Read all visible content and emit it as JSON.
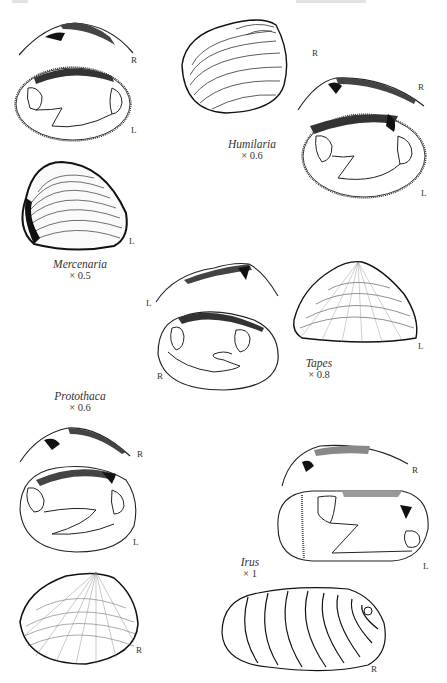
{
  "page": {
    "header_fragments": [
      "page-number-cut-off",
      "running-header-cut-off"
    ]
  },
  "figures": [
    {
      "id": "mercenaria",
      "genus": "Mercenaria",
      "scale": "× 0.5",
      "views": [
        {
          "kind": "hinge-profile",
          "valve": "R"
        },
        {
          "kind": "interior",
          "valve": "L"
        },
        {
          "kind": "exterior",
          "valve": "L"
        }
      ]
    },
    {
      "id": "humilaria",
      "genus": "Humilaria",
      "scale": "× 0.6",
      "views": [
        {
          "kind": "exterior",
          "valve": "R"
        },
        {
          "kind": "hinge-profile",
          "valve": "R"
        },
        {
          "kind": "interior",
          "valve": "L"
        }
      ]
    },
    {
      "id": "tapes",
      "genus": "Tapes",
      "scale": "× 0.8",
      "views": [
        {
          "kind": "hinge-profile",
          "valve": "L"
        },
        {
          "kind": "interior",
          "valve": "R"
        },
        {
          "kind": "exterior",
          "valve": "L"
        }
      ]
    },
    {
      "id": "protothaca",
      "genus": "Protothaca",
      "scale": "× 0.6",
      "views": [
        {
          "kind": "hinge-profile",
          "valve": "R"
        },
        {
          "kind": "interior",
          "valve": "L"
        },
        {
          "kind": "exterior",
          "valve": "R"
        }
      ]
    },
    {
      "id": "irus",
      "genus": "Irus",
      "scale": "× 1",
      "views": [
        {
          "kind": "hinge-profile",
          "valve": "R"
        },
        {
          "kind": "interior",
          "valve": "L"
        },
        {
          "kind": "exterior",
          "valve": "R"
        }
      ]
    }
  ]
}
